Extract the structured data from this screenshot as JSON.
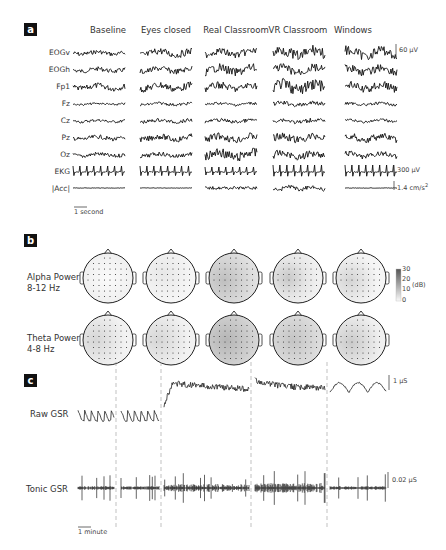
{
  "chart_data": [
    {
      "panel": "a",
      "type": "line",
      "title": "Raw physiological signals per condition",
      "conditions": [
        "Baseline",
        "Eyes closed",
        "Real Classroom",
        "VR Classroom",
        "Windows"
      ],
      "channels": [
        "EOGv",
        "EOGh",
        "Fp1",
        "Fz",
        "Cz",
        "Pz",
        "Oz",
        "EKG",
        "|Acc|"
      ],
      "scale_bars": {
        "eeg_eog": "60 µV",
        "ekg": "300 µV",
        "acc": "1.4 cm/s²",
        "time": "1 second"
      },
      "grid": false
    },
    {
      "panel": "b",
      "type": "heatmap",
      "title": "Scalp topographies of EEG band power",
      "conditions": [
        "Baseline",
        "Eyes closed",
        "Real Classroom",
        "VR Classroom",
        "Windows"
      ],
      "rows": [
        {
          "label": "Alpha Power",
          "band": "8-12 Hz",
          "relative_intensity": [
            0.08,
            0.08,
            0.45,
            0.3,
            0.22
          ]
        },
        {
          "label": "Theta Power",
          "band": "4-8 Hz",
          "relative_intensity": [
            0.18,
            0.2,
            0.55,
            0.38,
            0.28
          ]
        }
      ],
      "colorbar": {
        "label": "(dB)",
        "ticks": [
          0,
          10,
          20,
          30
        ],
        "range": [
          0,
          30
        ]
      }
    },
    {
      "panel": "c",
      "type": "line",
      "title": "Galvanic skin response",
      "series": [
        {
          "name": "Raw GSR",
          "scale": "1 µS"
        },
        {
          "name": "Tonic GSR",
          "scale": "0.02 µS"
        }
      ],
      "segments": [
        "Baseline",
        "Eyes closed",
        "Real Classroom",
        "VR Classroom",
        "Windows"
      ],
      "time_scale": "1 minute",
      "segment_separators": "dashed vertical lines"
    }
  ],
  "panel_a": {
    "tag": "a",
    "conditions": [
      "Baseline",
      "Eyes closed",
      "Real Classroom",
      "VR Classroom",
      "Windows"
    ],
    "channels": [
      "EOGv",
      "EOGh",
      "Fp1",
      "Fz",
      "Cz",
      "Pz",
      "Oz",
      "EKG",
      "|Acc|"
    ],
    "scale_uv": "60 µV",
    "scale_ekg": "300 µV",
    "scale_acc": "1.4 cm/s",
    "scale_acc_sup": "2",
    "time_bar": "1 second"
  },
  "panel_b": {
    "tag": "b",
    "alpha_label": "Alpha Power",
    "alpha_band": "8-12 Hz",
    "theta_label": "Theta Power",
    "theta_band": "4-8 Hz",
    "colorbar_unit": "(dB)",
    "colorbar_ticks": [
      "30",
      "20",
      "10",
      "0"
    ]
  },
  "panel_c": {
    "tag": "c",
    "raw_label": "Raw GSR",
    "tonic_label": "Tonic GSR",
    "raw_scale": "1 µS",
    "tonic_scale": "0.02 µS",
    "time_bar": "1 minute"
  }
}
